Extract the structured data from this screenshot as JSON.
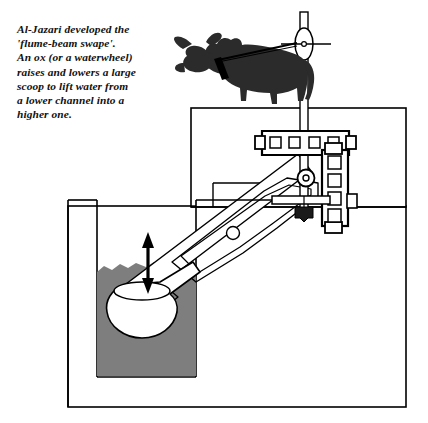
{
  "figure": {
    "caption": "Al-Jazari developed the\n'flume-beam swape'.\nAn ox (or a waterwheel)\nraises and lowers a large\nscoop to lift water from\na lower channel into a\nhigher one."
  },
  "colors": {
    "ink": "#111111",
    "outline": "#000000",
    "water": "#7e7e7e",
    "water_edge": "#6d6d6d",
    "ox_body": "#2b2b2b",
    "ox_dark": "#000000",
    "paper": "#ffffff",
    "scoop_fill": "#ffffff",
    "shadow": "#d9d9d9"
  },
  "parts": [
    {
      "id": "ox",
      "label": "ox",
      "description": "Dark silhouette of an ox standing on the upper platform, harnessed by a rope"
    },
    {
      "id": "rope",
      "label": "rope",
      "description": "Traction rope from the ox collar to the pulley at the top of the mast"
    },
    {
      "id": "mast",
      "label": "vertical mast",
      "description": "Tall vertical post rising above the machinery with a pulley eye near its top"
    },
    {
      "id": "pulley",
      "label": "pulley",
      "description": "Lens shaped pulley eye at the top of the mast with an axle line through it"
    },
    {
      "id": "crossbeam",
      "label": "perforated crossbeam",
      "description": "Horizontal timber beam with four square mortise holes and end lugs",
      "holes": 4
    },
    {
      "id": "column",
      "label": "perforated column",
      "description": "Vertical timber column with five square mortise holes forming the frame",
      "holes": 5
    },
    {
      "id": "pivot",
      "label": "pivot",
      "description": "Circular pivot bearing where the flume beam rocks on the frame"
    },
    {
      "id": "flume_beam",
      "label": "flume beam",
      "description": "Long diagonal flume beam reaching from the frame down to the scoop"
    },
    {
      "id": "beam_frame",
      "label": "beam counterframe",
      "description": "Rectangular outline frame around the upper part of the flume beam with a bearing eye"
    },
    {
      "id": "counterweight",
      "label": "counterweight",
      "description": "Small dark wedge weight on the lower end of the vertical rod"
    },
    {
      "id": "scoop",
      "label": "scoop",
      "description": "Large white scoop dipping into the lower channel"
    },
    {
      "id": "motion_arrow",
      "label": "motion arrow",
      "description": "Double headed vertical arrow showing the scoop rising and lowering"
    },
    {
      "id": "lower_channel",
      "label": "lower channel",
      "description": "Gray water filled lower channel at left"
    },
    {
      "id": "upper_platform",
      "label": "upper platform",
      "description": "Raised masonry platform on which the ox walks"
    },
    {
      "id": "basin",
      "label": "basin",
      "description": "Outer rectangular masonry basin enclosing the installation"
    }
  ],
  "annotations": {
    "motion": "up and down",
    "water_level_label": "lower channel"
  }
}
